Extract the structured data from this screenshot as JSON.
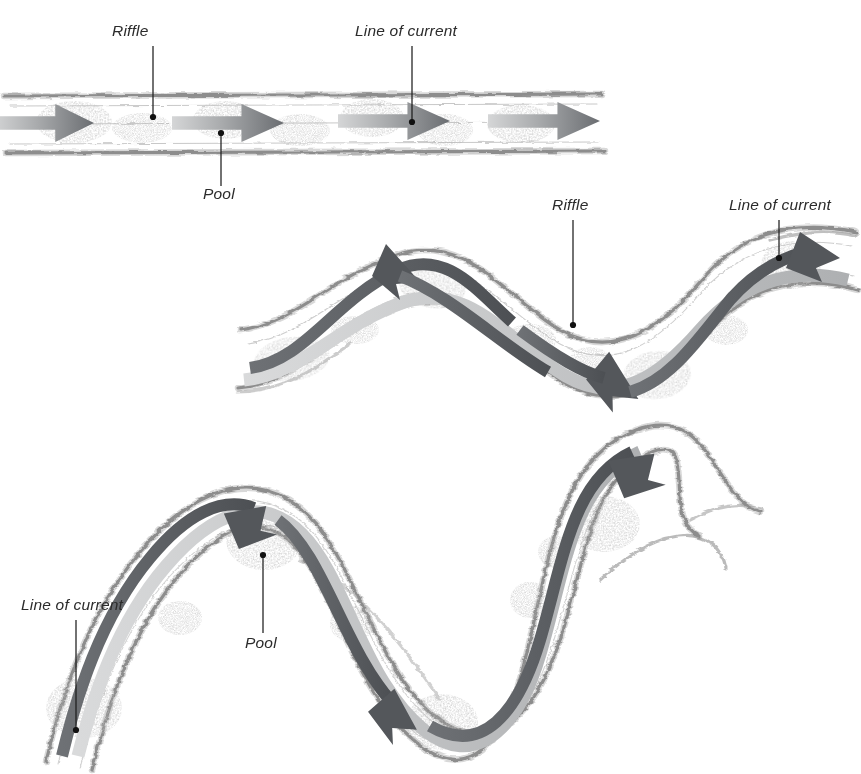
{
  "figure": {
    "background_color": "#ffffff",
    "width": 861,
    "height": 774,
    "style": "hand-drawn stippled pen-and-ink illustration, grayscale"
  },
  "palette": {
    "background": "#ffffff",
    "bank_line": "#8d8d8d",
    "bank_fuzz": "#a9a9a9",
    "gravel_stipple": "#8a8a8a",
    "arrow_dark": "#4f5154",
    "arrow_light": "#c9cacb",
    "current_band_dark": "#55585c",
    "current_band_light": "#b9babc",
    "label_text": "#2b2b2b",
    "leader_line": "#1d1d1d"
  },
  "panels": [
    {
      "id": "panel-straight",
      "name": "straight-reach",
      "order": 1,
      "description": "Straight channel reach with alternating riffles and pools and four downstream flow arrows",
      "channel_form": "straight",
      "flow_direction": "left-to-right",
      "arrow_count": 4,
      "labels": [
        {
          "id": "riffle-top",
          "text": "Riffle",
          "text_x": 112,
          "text_y": 36,
          "anchor": "start",
          "leader": {
            "x1": 153,
            "y1": 46,
            "x2": 153,
            "y2": 117
          },
          "dot": {
            "cx": 153,
            "cy": 117,
            "r": 3.1
          }
        },
        {
          "id": "line-of-current-top",
          "text": "Line of current",
          "text_x": 355,
          "text_y": 36,
          "anchor": "start",
          "leader": {
            "x1": 412,
            "y1": 46,
            "x2": 412,
            "y2": 122
          },
          "dot": {
            "cx": 412,
            "cy": 122,
            "r": 3.1
          }
        },
        {
          "id": "pool-top",
          "text": "Pool",
          "text_x": 203,
          "text_y": 199,
          "anchor": "start",
          "leader": {
            "x1": 221,
            "y1": 133,
            "x2": 221,
            "y2": 186
          },
          "dot": {
            "cx": 221,
            "cy": 133,
            "r": 3.1
          }
        }
      ]
    },
    {
      "id": "panel-sinuous",
      "name": "sinuous-reach",
      "order": 2,
      "description": "Gently sinuous channel with the line of current crossing between riffles at the inflections and pools at the bends",
      "channel_form": "sinuous",
      "flow_direction": "left-to-right",
      "arrow_count": 3,
      "labels": [
        {
          "id": "riffle-mid",
          "text": "Riffle",
          "text_x": 552,
          "text_y": 210,
          "anchor": "start",
          "leader": {
            "x1": 573,
            "y1": 220,
            "x2": 573,
            "y2": 325
          },
          "dot": {
            "cx": 573,
            "cy": 325,
            "r": 3.1
          }
        },
        {
          "id": "line-of-current-mid",
          "text": "Line of current",
          "text_x": 729,
          "text_y": 210,
          "anchor": "start",
          "leader": {
            "x1": 779,
            "y1": 220,
            "x2": 779,
            "y2": 258
          },
          "dot": {
            "cx": 779,
            "cy": 258,
            "r": 3.1
          }
        }
      ]
    },
    {
      "id": "panel-meandering",
      "name": "meandering-reach",
      "order": 3,
      "description": "Strongly meandering channel with deep pools on the outside of the bends and the current line swinging bank to bank",
      "channel_form": "meandering",
      "flow_direction": "left-to-right",
      "arrow_count": 3,
      "labels": [
        {
          "id": "line-of-current-bottom",
          "text": "Line of current",
          "text_x": 21,
          "text_y": 610,
          "anchor": "start",
          "leader": {
            "x1": 76,
            "y1": 620,
            "x2": 76,
            "y2": 730
          },
          "dot": {
            "cx": 76,
            "cy": 730,
            "r": 3.1
          }
        },
        {
          "id": "pool-bottom",
          "text": "Pool",
          "text_x": 245,
          "text_y": 648,
          "anchor": "start",
          "leader": {
            "x1": 263,
            "y1": 555,
            "x2": 263,
            "y2": 633
          },
          "dot": {
            "cx": 263,
            "cy": 555,
            "r": 3.1
          }
        }
      ]
    }
  ],
  "legend_terms": [
    {
      "term": "Riffle",
      "meaning": "shallow gravel bar where the stream bed rises"
    },
    {
      "term": "Pool",
      "meaning": "deep scoured basin, typically at the outside of a bend"
    },
    {
      "term": "Line of current",
      "meaning": "thread of maximum velocity through the channel"
    }
  ]
}
